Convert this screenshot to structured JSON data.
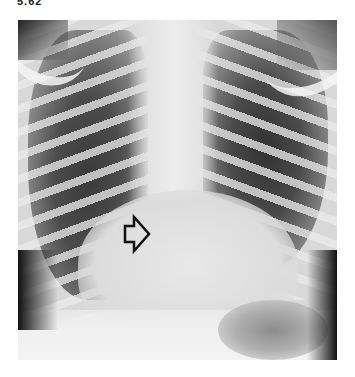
{
  "figure": {
    "label": "5.62",
    "image_alt": "Frontal chest radiograph with an open arrow pointing to the cardiac region",
    "annotation": {
      "type": "open-arrow",
      "direction": "right"
    }
  }
}
